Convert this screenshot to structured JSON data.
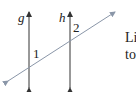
{
  "diagram": {
    "type": "parallel lines cut by a transversal",
    "lines": [
      {
        "name": "g",
        "label": "g",
        "orientation": "vertical",
        "arrows": "both"
      },
      {
        "name": "h",
        "label": "h",
        "orientation": "vertical",
        "arrows": "both"
      },
      {
        "name": "transversal",
        "label": "",
        "orientation": "diagonal",
        "arrows": "both"
      }
    ],
    "angles": [
      {
        "label": "1",
        "at": "intersection of g and transversal"
      },
      {
        "label": "2",
        "at": "intersection of h and transversal"
      }
    ],
    "colors": {
      "parallel_lines": "#333333",
      "transversal": "#8a96a8",
      "text": "#222222"
    }
  },
  "labels": {
    "g": "g",
    "h": "h",
    "angle1": "1",
    "angle2": "2"
  },
  "side_text": {
    "line1": "Li",
    "line2": "to"
  }
}
